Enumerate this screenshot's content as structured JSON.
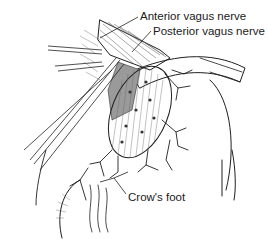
{
  "figure": {
    "type": "anatomical line illustration",
    "labels": [
      {
        "id": "anterior",
        "text": "Anterior vagus nerve",
        "x": 140,
        "y": 12
      },
      {
        "id": "posterior",
        "text": "Posterior vagus nerve",
        "x": 153,
        "y": 27
      },
      {
        "id": "crows_foot",
        "text": "Crow's foot",
        "x": 128,
        "y": 195
      }
    ],
    "colors": {
      "ink": "#1f1f1f",
      "background": "#ffffff",
      "shade": "#9a9a9a"
    }
  }
}
